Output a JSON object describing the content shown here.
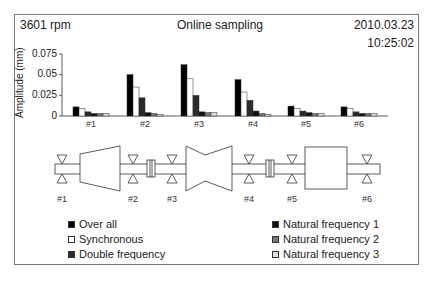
{
  "header": {
    "rpm": "3601 rpm",
    "title": "Online sampling",
    "date": "2010.03.23",
    "time": "10:25:02"
  },
  "chart_data": {
    "type": "bar",
    "title": "Online sampling",
    "xlabel": "",
    "ylabel": "Amplitude (mm)",
    "ylim": [
      0,
      0.075
    ],
    "yticks": [
      "0.075",
      "0.05",
      "0.025",
      "0"
    ],
    "grid": false,
    "legend_position": "bottom",
    "categories": [
      "#1",
      "#2",
      "#3",
      "#4",
      "#5",
      "#6"
    ],
    "series": [
      {
        "name": "Over all",
        "color": "#000000",
        "values": [
          0.011,
          0.05,
          0.062,
          0.044,
          0.012,
          0.011
        ]
      },
      {
        "name": "Synchronous",
        "color": "#ffffff",
        "values": [
          0.009,
          0.035,
          0.045,
          0.029,
          0.009,
          0.009
        ]
      },
      {
        "name": "Double frequency",
        "color": "#2a2a2a",
        "values": [
          0.005,
          0.022,
          0.025,
          0.019,
          0.006,
          0.005
        ]
      },
      {
        "name": "Natural frequency 1",
        "color": "#111111",
        "values": [
          0.003,
          0.004,
          0.005,
          0.006,
          0.004,
          0.003
        ]
      },
      {
        "name": "Natural frequency 2",
        "color": "#777777",
        "values": [
          0.003,
          0.003,
          0.004,
          0.003,
          0.003,
          0.003
        ]
      },
      {
        "name": "Natural frequency 3",
        "color": "#dddddd",
        "values": [
          0.003,
          0.002,
          0.004,
          0.002,
          0.003,
          0.003
        ]
      }
    ]
  },
  "diagram": {
    "bearing_labels": [
      "#1",
      "#2",
      "#3",
      "#4",
      "#5",
      "#6"
    ]
  },
  "legend": {
    "left": [
      {
        "label": "Over all",
        "color": "#000000"
      },
      {
        "label": "Synchronous",
        "color": "#ffffff"
      },
      {
        "label": "Double frequency",
        "color": "#2a2a2a"
      }
    ],
    "right": [
      {
        "label": "Natural frequency 1",
        "color": "#111111"
      },
      {
        "label": "Natural frequency 2",
        "color": "#777777"
      },
      {
        "label": "Natural frequency 3",
        "color": "#dddddd"
      }
    ]
  }
}
